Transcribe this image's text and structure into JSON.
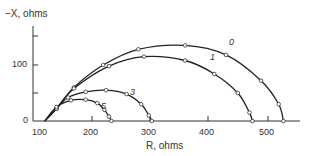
{
  "chart_data": {
    "type": "line",
    "title": "",
    "xlabel": "R, ohms",
    "ylabel": "−X, ohms",
    "xlim": [
      100,
      560
    ],
    "ylim": [
      0,
      165
    ],
    "x_ticks": [
      "100",
      "200",
      "300",
      "400",
      "500"
    ],
    "y_ticks": [
      "0",
      "100"
    ],
    "y_minor_ticks": [
      50,
      150
    ],
    "grid": false,
    "legend": "inline curve labels",
    "series": [
      {
        "name": "0",
        "color": "#222222",
        "points": [
          [
            120,
            0
          ],
          [
            140,
            22
          ],
          [
            170,
            60
          ],
          [
            220,
            100
          ],
          [
            280,
            128
          ],
          [
            360,
            135
          ],
          [
            430,
            118
          ],
          [
            490,
            72
          ],
          [
            520,
            30
          ],
          [
            528,
            0
          ]
        ]
      },
      {
        "name": "1",
        "color": "#222222",
        "points": [
          [
            120,
            0
          ],
          [
            140,
            22
          ],
          [
            170,
            58
          ],
          [
            230,
            98
          ],
          [
            290,
            115
          ],
          [
            360,
            108
          ],
          [
            410,
            84
          ],
          [
            450,
            50
          ],
          [
            470,
            15
          ],
          [
            475,
            0
          ]
        ]
      },
      {
        "name": "3",
        "color": "#222222",
        "points": [
          [
            120,
            0
          ],
          [
            140,
            22
          ],
          [
            160,
            42
          ],
          [
            190,
            52
          ],
          [
            225,
            55
          ],
          [
            260,
            48
          ],
          [
            285,
            30
          ],
          [
            298,
            10
          ],
          [
            303,
            0
          ]
        ]
      },
      {
        "name": "5",
        "color": "#222222",
        "points": [
          [
            120,
            0
          ],
          [
            140,
            25
          ],
          [
            165,
            37
          ],
          [
            190,
            38
          ],
          [
            210,
            32
          ],
          [
            222,
            20
          ],
          [
            230,
            8
          ],
          [
            234,
            0
          ]
        ]
      }
    ]
  },
  "labels": {
    "ylabel": "−X, ohms",
    "xlabel": "R, ohms",
    "y100": "100",
    "y0": "0",
    "x100": "100",
    "x200": "200",
    "x300": "300",
    "x400": "400",
    "x500": "500",
    "c0": "0",
    "c1": "1",
    "c3": "3",
    "c5": "5"
  }
}
